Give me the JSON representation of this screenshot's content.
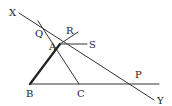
{
  "diagram": {
    "type": "geometry",
    "colors": {
      "line": "#333333",
      "bold_line": "#222222",
      "label": "#222222",
      "background": "#ffffff"
    },
    "points": [
      {
        "id": "X",
        "label": "X",
        "x": 19,
        "y": 13,
        "lx": 9,
        "ly": 16
      },
      {
        "id": "Y",
        "label": "Y",
        "x": 154,
        "y": 100,
        "lx": 157,
        "ly": 104
      },
      {
        "id": "Q",
        "label": "Q",
        "x": 41,
        "y": 26,
        "lx": 35,
        "ly": 37
      },
      {
        "id": "R",
        "label": "R",
        "x": 71,
        "y": 37,
        "lx": 66,
        "ly": 34
      },
      {
        "id": "S",
        "label": "S",
        "x": 87,
        "y": 44,
        "lx": 89,
        "ly": 48
      },
      {
        "id": "A",
        "label": "A",
        "x": 60,
        "y": 44,
        "lx": 49,
        "ly": 50
      },
      {
        "id": "B",
        "label": "B",
        "x": 30,
        "y": 84,
        "lx": 26,
        "ly": 97
      },
      {
        "id": "C",
        "label": "C",
        "x": 79,
        "y": 84,
        "lx": 77,
        "ly": 97
      },
      {
        "id": "P",
        "label": "P",
        "x": 137,
        "y": 84,
        "lx": 135,
        "ly": 78
      }
    ],
    "segments": [
      {
        "name": "line-XY",
        "x1": 19,
        "y1": 13,
        "x2": 154,
        "y2": 100,
        "bold": false
      },
      {
        "name": "line-QC",
        "x1": 38,
        "y1": 21,
        "x2": 79,
        "y2": 84,
        "bold": false
      },
      {
        "name": "line-BA",
        "x1": 30,
        "y1": 84,
        "x2": 60,
        "y2": 44,
        "bold": true
      },
      {
        "name": "line-AR",
        "x1": 60,
        "y1": 44,
        "x2": 78,
        "y2": 32,
        "bold": false
      },
      {
        "name": "line-AS",
        "x1": 60,
        "y1": 44,
        "x2": 87,
        "y2": 44,
        "bold": false
      },
      {
        "name": "line-BP",
        "x1": 30,
        "y1": 84,
        "x2": 159,
        "y2": 84,
        "bold": false
      }
    ]
  }
}
